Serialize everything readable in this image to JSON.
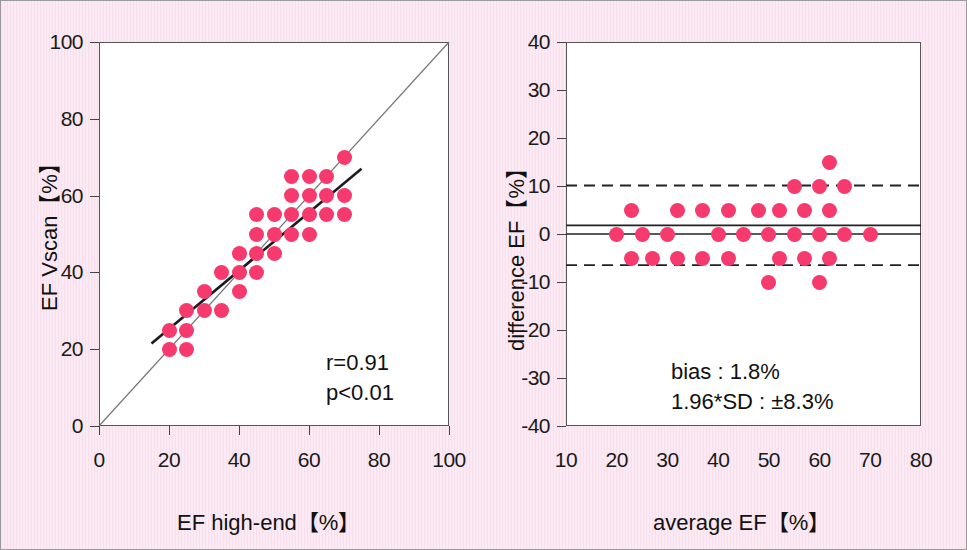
{
  "figure": {
    "background_color": "#f9e6f1",
    "point_color": "#f63a6e",
    "axis_color": "#555555"
  },
  "chart_data": [
    {
      "id": "left",
      "type": "scatter",
      "title": "",
      "xlabel": "EF high-end【%】",
      "ylabel": "EF Vscan【%】",
      "xlim": [
        0,
        100
      ],
      "ylim": [
        0,
        100
      ],
      "xticks": [
        0,
        20,
        40,
        60,
        80,
        100
      ],
      "yticks": [
        0,
        20,
        40,
        60,
        80,
        100
      ],
      "xticklabels": [
        "0",
        "20",
        "40",
        "60",
        "80",
        "100"
      ],
      "yticklabels": [
        "0",
        "20",
        "40",
        "60",
        "80",
        "100"
      ],
      "grid": false,
      "legend": "none",
      "annotations": [
        "r=0.91",
        "p<0.01"
      ],
      "reference_line": {
        "name": "identity-line",
        "from": [
          0,
          0
        ],
        "to": [
          100,
          100
        ],
        "style": "solid-thin"
      },
      "fit_line": {
        "name": "regression-line",
        "from": [
          15,
          21.5
        ],
        "to": [
          75,
          67
        ],
        "style": "solid-thick"
      },
      "points": [
        [
          20,
          20
        ],
        [
          20,
          25
        ],
        [
          25,
          20
        ],
        [
          25,
          25
        ],
        [
          25,
          30
        ],
        [
          30,
          30
        ],
        [
          35,
          30
        ],
        [
          30,
          35
        ],
        [
          40,
          35
        ],
        [
          35,
          40
        ],
        [
          40,
          40
        ],
        [
          45,
          40
        ],
        [
          40,
          45
        ],
        [
          45,
          45
        ],
        [
          50,
          45
        ],
        [
          45,
          50
        ],
        [
          50,
          50
        ],
        [
          55,
          50
        ],
        [
          60,
          50
        ],
        [
          45,
          55
        ],
        [
          50,
          55
        ],
        [
          55,
          55
        ],
        [
          60,
          55
        ],
        [
          65,
          55
        ],
        [
          70,
          55
        ],
        [
          55,
          60
        ],
        [
          60,
          60
        ],
        [
          65,
          60
        ],
        [
          70,
          60
        ],
        [
          55,
          65
        ],
        [
          60,
          65
        ],
        [
          65,
          65
        ],
        [
          70,
          70
        ]
      ]
    },
    {
      "id": "right",
      "type": "scatter",
      "title": "",
      "xlabel": "average EF【%】",
      "ylabel": "difference EF【%】",
      "xlim": [
        10,
        80
      ],
      "ylim": [
        -40,
        40
      ],
      "xticks": [
        10,
        20,
        30,
        40,
        50,
        60,
        70,
        80
      ],
      "yticks": [
        -40,
        -30,
        -20,
        -10,
        0,
        10,
        20,
        30,
        40
      ],
      "xticklabels": [
        "10",
        "20",
        "30",
        "40",
        "50",
        "60",
        "70",
        "80"
      ],
      "yticklabels": [
        "-40",
        "-30",
        "-20",
        "-10",
        "0",
        "10",
        "20",
        "30",
        "40"
      ],
      "grid": false,
      "legend": "none",
      "annotations": [
        "bias : 1.8%",
        "1.96*SD : ±8.3%"
      ],
      "bias_line": {
        "name": "bias-line",
        "y": 1.8,
        "style": "solid-thin"
      },
      "zero_line": {
        "name": "zero-line",
        "y": 0,
        "style": "solid-thin"
      },
      "upper_loa_line": {
        "name": "upper-limit-of-agreement",
        "y": 10.1,
        "style": "dashed"
      },
      "lower_loa_line": {
        "name": "lower-limit-of-agreement",
        "y": -6.5,
        "style": "dashed"
      },
      "points": [
        [
          20,
          0
        ],
        [
          23,
          5
        ],
        [
          23,
          -5
        ],
        [
          25,
          0
        ],
        [
          27,
          -5
        ],
        [
          30,
          0
        ],
        [
          32,
          5
        ],
        [
          32,
          -5
        ],
        [
          37,
          5
        ],
        [
          37,
          -5
        ],
        [
          40,
          0
        ],
        [
          42,
          5
        ],
        [
          42,
          -5
        ],
        [
          45,
          0
        ],
        [
          48,
          5
        ],
        [
          50,
          0
        ],
        [
          50,
          -10
        ],
        [
          52,
          5
        ],
        [
          52,
          -5
        ],
        [
          55,
          0
        ],
        [
          55,
          10
        ],
        [
          57,
          5
        ],
        [
          57,
          -5
        ],
        [
          60,
          0
        ],
        [
          60,
          10
        ],
        [
          60,
          -10
        ],
        [
          62,
          5
        ],
        [
          62,
          -5
        ],
        [
          62,
          15
        ],
        [
          65,
          0
        ],
        [
          65,
          10
        ],
        [
          70,
          0
        ]
      ]
    }
  ],
  "left_panel": {
    "ylabel": "EF Vscan【%】",
    "xlabel": "EF high-end【%】",
    "yticklabels": [
      "100",
      "80",
      "60",
      "40",
      "20",
      "0"
    ],
    "xticklabels": [
      "0",
      "20",
      "40",
      "60",
      "80",
      "100"
    ],
    "annotation_line1": "r=0.91",
    "annotation_line2": "p<0.01"
  },
  "right_panel": {
    "ylabel": "difference EF【%】",
    "xlabel": "average EF【%】",
    "yticklabels": [
      "40",
      "30",
      "20",
      "10",
      "0",
      "-10",
      "-20",
      "-30",
      "-40"
    ],
    "xticklabels": [
      "10",
      "20",
      "30",
      "40",
      "50",
      "60",
      "70",
      "80"
    ],
    "annotation_line1": "bias : 1.8%",
    "annotation_line2": "1.96*SD : ±8.3%"
  }
}
